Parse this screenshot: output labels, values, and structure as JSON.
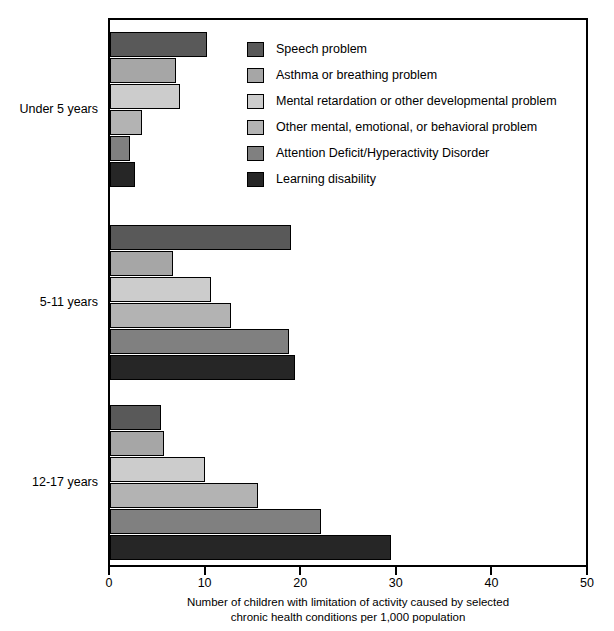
{
  "chart_data": {
    "type": "bar",
    "orientation": "horizontal",
    "title": "",
    "xlabel": "Number of children with limitation of activity caused by selected chronic health conditions per 1,000 population",
    "xlabel_lines": [
      "Number of children with limitation of activity caused by selected",
      "chronic health conditions per 1,000 population"
    ],
    "ylabel": "",
    "xlim": [
      0,
      50
    ],
    "xticks": [
      0,
      10,
      20,
      30,
      40,
      50
    ],
    "xtick_labels": [
      "0",
      "10",
      "20",
      "30",
      "40",
      "50"
    ],
    "grid": false,
    "legend_position": "top-right-inside",
    "categories": [
      "Under 5 years",
      "5-11 years",
      "12-17 years"
    ],
    "series": [
      {
        "name": "Speech problem",
        "color": "#595959",
        "values": [
          10.1,
          18.9,
          5.3
        ]
      },
      {
        "name": "Asthma or breathing problem",
        "color": "#a6a6a6",
        "values": [
          6.9,
          6.6,
          5.6
        ]
      },
      {
        "name": "Mental retardation or other developmental problem",
        "color": "#cccccc",
        "values": [
          7.3,
          10.6,
          9.9
        ]
      },
      {
        "name": "Other mental, emotional, or behavioral problem",
        "color": "#b3b3b3",
        "values": [
          3.3,
          12.7,
          15.5
        ]
      },
      {
        "name": "Attention Deficit/Hyperactivity Disorder",
        "color": "#808080",
        "values": [
          2.1,
          18.7,
          22.1
        ]
      },
      {
        "name": "Learning disability",
        "color": "#262626",
        "values": [
          2.6,
          19.3,
          29.4
        ]
      }
    ]
  },
  "legend": {
    "items": [
      {
        "label": "Speech problem",
        "color": "#595959"
      },
      {
        "label": "Asthma or breathing problem",
        "color": "#a6a6a6"
      },
      {
        "label": "Mental retardation or other developmental problem",
        "color": "#cccccc"
      },
      {
        "label": "Other mental, emotional, or behavioral problem",
        "color": "#b3b3b3"
      },
      {
        "label": "Attention Deficit/Hyperactivity Disorder",
        "color": "#808080"
      },
      {
        "label": "Learning disability",
        "color": "#262626"
      }
    ]
  },
  "axis": {
    "x_tick_labels": [
      "0",
      "10",
      "20",
      "30",
      "40",
      "50"
    ],
    "x_title_line1": "Number of children with limitation of activity caused by selected",
    "x_title_line2": "chronic health conditions per 1,000 population",
    "y_group_labels": [
      "Under 5 years",
      "5-11 years",
      "12-17 years"
    ]
  }
}
